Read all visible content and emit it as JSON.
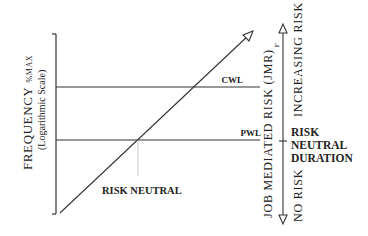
{
  "diagram": {
    "y_axis": {
      "title_main": "FREQUENCY",
      "title_sub": "%MAX",
      "subtitle": "(Logarithmic Scale)"
    },
    "lines": {
      "cwl": {
        "label": "CWL"
      },
      "pwl": {
        "label": "PWL"
      }
    },
    "annotations": {
      "risk_neutral": "RISK NEUTRAL",
      "risk_neutral_duration": [
        "RISK",
        "NEUTRAL",
        "DURATION"
      ]
    },
    "right_axis": {
      "title": "JOB MEDIATED RISK (JMR)",
      "title_sub": "F",
      "top_label": "INCREASING RISK",
      "bottom_label": "NO RISK"
    },
    "colors": {
      "line": "#333333",
      "text": "#222222",
      "faint": "#bbbbbb"
    }
  }
}
